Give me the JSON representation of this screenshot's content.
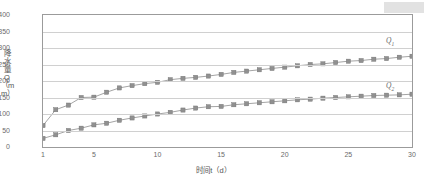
{
  "chart_data": {
    "type": "line",
    "title": "",
    "xlabel": "时间t（d）",
    "ylabel": "降水量Q（mm）",
    "xlim": [
      1,
      30
    ],
    "ylim": [
      0,
      400
    ],
    "yticks": [
      0,
      50,
      100,
      150,
      200,
      250,
      300,
      350,
      400
    ],
    "xticks": [
      1,
      5,
      10,
      15,
      20,
      25,
      30
    ],
    "grid": true,
    "legend": "inline-annotation",
    "x": [
      1,
      2,
      3,
      4,
      5,
      6,
      7,
      8,
      9,
      10,
      11,
      12,
      13,
      14,
      15,
      16,
      17,
      18,
      19,
      20,
      21,
      22,
      23,
      24,
      25,
      26,
      27,
      28,
      29,
      30
    ],
    "series": [
      {
        "name": "Q1",
        "label": "Q",
        "sub": "1",
        "color": "#909090",
        "marker": "square",
        "values": [
          65,
          113,
          127,
          150,
          151,
          166,
          179,
          186,
          192,
          196,
          204,
          208,
          211,
          215,
          220,
          226,
          230,
          234,
          238,
          242,
          246,
          250,
          252,
          256,
          260,
          262,
          266,
          268,
          272,
          275
        ]
      },
      {
        "name": "Q2",
        "label": "Q",
        "sub": "2",
        "color": "#909090",
        "marker": "square",
        "values": [
          26,
          37,
          50,
          57,
          67,
          72,
          81,
          88,
          94,
          100,
          105,
          112,
          118,
          122,
          123,
          128,
          131,
          134,
          137,
          140,
          143,
          145,
          148,
          150,
          152,
          154,
          156,
          157,
          158,
          160
        ]
      }
    ]
  },
  "annotations": {
    "q1_label": "Q",
    "q1_sub": "1",
    "q2_label": "Q",
    "q2_sub": "2"
  },
  "axis": {
    "y_title": "降水量Q（mm）",
    "x_title": "时间t（d）"
  }
}
